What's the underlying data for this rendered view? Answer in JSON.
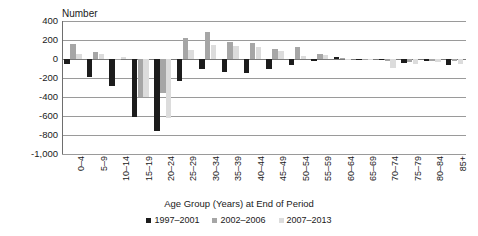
{
  "chart_data": {
    "type": "bar",
    "title": "",
    "subtitle": "",
    "ylabel": "Number",
    "xlabel": "Age Group (Years) at End of Period",
    "ylim": [
      -1000,
      400
    ],
    "ytick_step": 200,
    "ytick_labels": [
      "400",
      "200",
      "0",
      "-200",
      "-400",
      "-600",
      "-800",
      "-1,000"
    ],
    "ytick_values": [
      400,
      200,
      0,
      -200,
      -400,
      -600,
      -800,
      -1000
    ],
    "grid": true,
    "legend_position": "bottom",
    "categories": [
      "0-4",
      "5-9",
      "10-14",
      "15-19",
      "20-24",
      "25-29",
      "30-34",
      "35-39",
      "40-44",
      "45-49",
      "50-54",
      "55-59",
      "60-64",
      "65-69",
      "70-74",
      "75-79",
      "80-84",
      "85+"
    ],
    "series": [
      {
        "name": "1997-2001",
        "color": "#1c1c1c",
        "values": [
          -55,
          -185,
          -285,
          -615,
          -755,
          -230,
          -100,
          -135,
          -145,
          -110,
          -60,
          -20,
          25,
          -5,
          -15,
          -40,
          -25,
          -60
        ]
      },
      {
        "name": "2002-2006",
        "color": "#a6a6a6",
        "values": [
          155,
          70,
          -10,
          -405,
          -355,
          220,
          280,
          175,
          165,
          110,
          125,
          55,
          15,
          -5,
          -20,
          -30,
          -25,
          -25
        ]
      },
      {
        "name": "2007-2013",
        "color": "#dcdcdc",
        "values": [
          55,
          55,
          25,
          -405,
          -620,
          100,
          150,
          140,
          130,
          80,
          35,
          45,
          5,
          -15,
          -90,
          -55,
          -35,
          -50
        ]
      }
    ]
  },
  "legend": {
    "items": [
      {
        "label": "1997–2001",
        "color": "#1c1c1c"
      },
      {
        "label": "2002–2006",
        "color": "#a6a6a6"
      },
      {
        "label": "2007–2013",
        "color": "#dcdcdc"
      }
    ]
  },
  "axis": {
    "y_title": "Number",
    "x_title": "Age Group (Years) at End of Period"
  }
}
